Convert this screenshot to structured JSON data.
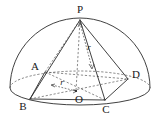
{
  "figure": {
    "labels": {
      "apex": "P",
      "vertex_a": "A",
      "vertex_b": "B",
      "vertex_c": "C",
      "vertex_d": "D",
      "center": "O",
      "radius_horizontal": "r",
      "radius_slant": "r"
    },
    "colors": {
      "stroke": "#2b2b2b",
      "hidden_stroke": "#5a5a5a",
      "background": "#ffffff"
    },
    "geometry": {
      "apex_point": [
        80,
        20
      ],
      "center_point": [
        76,
        91
      ],
      "vertex_a_point": [
        45,
        72
      ],
      "vertex_b_point": [
        30,
        99
      ],
      "vertex_c_point": [
        105,
        100
      ],
      "vertex_d_point": [
        128,
        79
      ],
      "base_ellipse_center": [
        80,
        88
      ],
      "base_ellipse_rx": 70,
      "base_ellipse_ry": 17,
      "dome_radius": 70
    }
  }
}
